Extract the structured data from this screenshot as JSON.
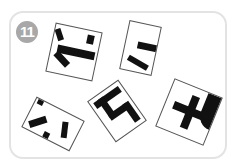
{
  "puzzle": {
    "number_badge": "11",
    "badge_color": "#a8a8a8",
    "frame_border_color": "#e3e3e3",
    "tile_count": 5,
    "tiles": [
      {
        "id": "tile-1",
        "description": "fragment with horizontal stroke and diagonal strokes on left",
        "rotation_deg": 12
      },
      {
        "id": "tile-2",
        "description": "fragment with two short horizontal strokes",
        "rotation_deg": 12
      },
      {
        "id": "tile-3",
        "description": "fragment with cross-shaped strokes and curve",
        "rotation_deg": 22
      },
      {
        "id": "tile-4",
        "description": "fragment with diagonal strokes and dots",
        "rotation_deg": 27
      },
      {
        "id": "tile-5",
        "description": "fragment with L-shaped hooked stroke",
        "rotation_deg": -35
      }
    ]
  }
}
